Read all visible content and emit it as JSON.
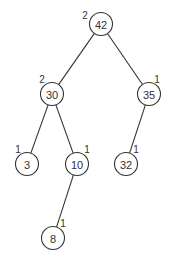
{
  "diagram": {
    "type": "binary-search-tree (AVL with heights)",
    "colors": {
      "stroke": "#333333",
      "background": "#ffffff"
    },
    "node_radius": 11.5,
    "nodes": [
      {
        "id": "n42",
        "value": "42",
        "height": "2",
        "cx": 101,
        "cy": 24,
        "lx": 85,
        "ly": 15
      },
      {
        "id": "n30",
        "value": "30",
        "height": "2",
        "cx": 52,
        "cy": 94,
        "lx": 42,
        "ly": 79
      },
      {
        "id": "n35",
        "value": "35",
        "height": "1",
        "cx": 149,
        "cy": 94,
        "lx": 157,
        "ly": 79
      },
      {
        "id": "n3",
        "value": "3",
        "height": "1",
        "cx": 27,
        "cy": 164,
        "lx": 18,
        "ly": 149
      },
      {
        "id": "n10",
        "value": "10",
        "height": "1",
        "cx": 77,
        "cy": 164,
        "lx": 87,
        "ly": 149
      },
      {
        "id": "n32",
        "value": "32",
        "height": "1",
        "cx": 126,
        "cy": 164,
        "lx": 136,
        "ly": 149
      },
      {
        "id": "n8",
        "value": "8",
        "height": "1",
        "cx": 53,
        "cy": 238,
        "lx": 63,
        "ly": 223
      }
    ],
    "edges": [
      {
        "from": "n42",
        "to": "n30"
      },
      {
        "from": "n42",
        "to": "n35"
      },
      {
        "from": "n30",
        "to": "n3"
      },
      {
        "from": "n30",
        "to": "n10"
      },
      {
        "from": "n35",
        "to": "n32"
      },
      {
        "from": "n10",
        "to": "n8"
      }
    ]
  }
}
